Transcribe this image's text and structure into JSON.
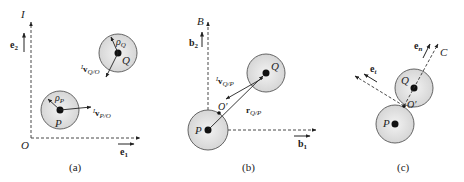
{
  "figure": {
    "panels": [
      {
        "caption": "(a)",
        "frame_label": "I",
        "axis_labels": {
          "y": "e",
          "y_sub": "2",
          "x": "e",
          "x_sub": "1",
          "origin": "O"
        },
        "bodies": [
          {
            "name": "P",
            "radius_label": "ρ",
            "radius_sub": "P",
            "velocity_pre": "I",
            "velocity": "v",
            "velocity_sub": "P/O"
          },
          {
            "name": "Q",
            "radius_label": "ρ",
            "radius_sub": "Q",
            "velocity_pre": "I",
            "velocity": "v",
            "velocity_sub": "Q/O"
          }
        ]
      },
      {
        "caption": "(b)",
        "frame_label": "B",
        "axis_labels": {
          "y": "b",
          "y_sub": "2",
          "x": "b",
          "x_sub": "1"
        },
        "bodies": [
          {
            "name": "P"
          },
          {
            "name": "Q"
          }
        ],
        "point": "O′",
        "relative_velocity": {
          "pre": "I",
          "vec": "v",
          "sub": "Q/P"
        },
        "relative_position": {
          "vec": "r",
          "sub": "Q/P"
        }
      },
      {
        "caption": "(c)",
        "frame_label": "C",
        "bodies": [
          {
            "name": "P"
          },
          {
            "name": "Q"
          }
        ],
        "point": "O′",
        "unit_vectors": [
          {
            "vec": "e",
            "sub": "t"
          },
          {
            "vec": "e",
            "sub": "n"
          }
        ]
      }
    ],
    "colors": {
      "line": "#222222",
      "disk_fill": "#e6e6e6",
      "disk_stroke": "#555555"
    }
  }
}
